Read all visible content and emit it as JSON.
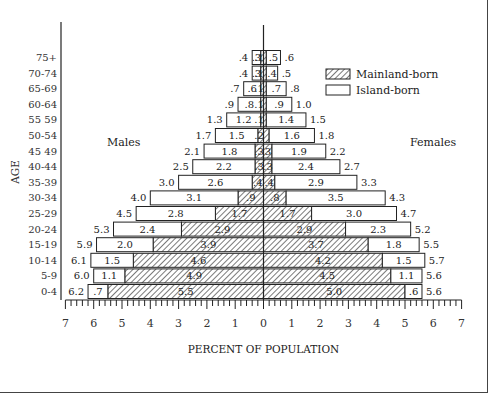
{
  "chart_data": {
    "type": "bar",
    "subtype": "population-pyramid",
    "title": "",
    "xlabel": "PERCENT OF POPULATION",
    "ylabel": "AGE",
    "xlim": [
      -7,
      7
    ],
    "x_ticks": [
      "7",
      "6",
      "5",
      "4",
      "3",
      "2",
      "1",
      "0",
      "1",
      "2",
      "3",
      "4",
      "5",
      "6",
      "7"
    ],
    "side_labels": {
      "left": "Males",
      "right": "Females"
    },
    "legend": [
      {
        "name": "Mainland-born",
        "pattern": "hatched"
      },
      {
        "name": "Island-born",
        "pattern": "open"
      }
    ],
    "categories": [
      "75+",
      "70-74",
      "65-69",
      "60-64",
      "55 59",
      "50-54",
      "45 49",
      "40-44",
      "35-39",
      "30-34",
      "25-29",
      "20-24",
      "15-19",
      "10-14",
      "5-9",
      "0-4"
    ],
    "series": [
      {
        "name": "Males Mainland-born",
        "values": [
          0.1,
          0.1,
          0.1,
          0.1,
          0.1,
          0.2,
          0.3,
          0.3,
          0.4,
          0.9,
          1.7,
          2.9,
          3.9,
          4.6,
          4.9,
          5.5
        ]
      },
      {
        "name": "Males Island-born",
        "values": [
          0.3,
          0.3,
          0.6,
          0.8,
          1.2,
          1.5,
          1.8,
          2.2,
          2.6,
          3.1,
          2.8,
          2.4,
          2.0,
          1.5,
          1.1,
          0.7
        ]
      },
      {
        "name": "Males Total",
        "values": [
          0.4,
          0.4,
          0.7,
          0.9,
          1.3,
          1.7,
          2.1,
          2.5,
          3.0,
          4.0,
          4.5,
          5.3,
          5.9,
          6.1,
          6.0,
          6.2
        ]
      },
      {
        "name": "Females Mainland-born",
        "values": [
          0.1,
          0.1,
          0.1,
          0.1,
          0.1,
          0.2,
          0.3,
          0.3,
          0.4,
          0.8,
          1.7,
          2.9,
          3.7,
          4.2,
          4.5,
          5.0
        ]
      },
      {
        "name": "Females Island-born",
        "values": [
          0.5,
          0.4,
          0.7,
          0.9,
          1.4,
          1.6,
          1.9,
          2.4,
          2.9,
          3.5,
          3.0,
          2.3,
          1.8,
          1.5,
          1.1,
          0.6
        ]
      },
      {
        "name": "Females Total",
        "values": [
          0.6,
          0.5,
          0.8,
          1.0,
          1.5,
          1.8,
          2.2,
          2.7,
          3.3,
          4.3,
          4.7,
          5.2,
          5.5,
          5.7,
          5.6,
          5.6
        ]
      }
    ],
    "labels": {
      "male_total": [
        ".4",
        ".4",
        ".7",
        ".9",
        "1.3",
        "1.7",
        "2.1",
        "2.5",
        "3.0",
        "4.0",
        "4.5",
        "5.3",
        "5.9",
        "6.1",
        "6.0",
        "6.2"
      ],
      "male_island": [
        ".3",
        ".3",
        ".6",
        ".8",
        "1.2",
        "1.5",
        "1.8",
        "2.2",
        "2.6",
        "3.1",
        "2.8",
        "2.4",
        "2.0",
        "1.5",
        "1.1",
        ".7"
      ],
      "male_main": [
        ".1",
        ".1",
        ".1",
        ".1",
        ".1",
        ".2",
        ".3",
        ".3",
        ".4",
        ".9",
        "1.7",
        "2.9",
        "3.9",
        "4.6",
        "4.9",
        "5.5"
      ],
      "female_main": [
        "",
        "",
        "",
        "",
        "",
        "",
        "3",
        ".3",
        ".4",
        ".8",
        "1.7",
        "2.9",
        "3.7",
        "4.2",
        "4.5",
        "5.0"
      ],
      "female_island": [
        ".5",
        ".4",
        ".7",
        ".9",
        "1.4",
        "1.6",
        "1.9",
        "2.4",
        "2.9",
        "3.5",
        "3.0",
        "2.3",
        "1.8",
        "1.5",
        "1.1",
        ".6"
      ],
      "female_total": [
        ".6",
        ".5",
        ".8",
        "1.0",
        "1.5",
        "1.8",
        "2.2",
        "2.7",
        "3.3",
        "4.3",
        "4.7",
        "5.2",
        "5.5",
        "5.7",
        "5.6",
        "5.6"
      ]
    },
    "grid": false,
    "legend_position": "upper right"
  }
}
